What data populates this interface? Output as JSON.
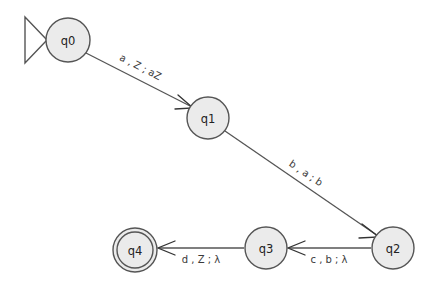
{
  "diagram": {
    "type": "pda-state-diagram",
    "background_color": "#ffffff",
    "node_fill_color": "#ebebeb",
    "node_stroke_color": "#555555",
    "edge_color": "#555555"
  },
  "states": [
    {
      "id": "q0",
      "label": "q0",
      "cx": 68,
      "cy": 40,
      "r": 22,
      "accepting": false,
      "start": true
    },
    {
      "id": "q1",
      "label": "q1",
      "cx": 208,
      "cy": 118,
      "r": 21,
      "accepting": false,
      "start": false
    },
    {
      "id": "q2",
      "label": "q2",
      "cx": 393,
      "cy": 248,
      "r": 21,
      "accepting": false,
      "start": false
    },
    {
      "id": "q3",
      "label": "q3",
      "cx": 266,
      "cy": 248,
      "r": 21,
      "accepting": false,
      "start": false
    },
    {
      "id": "q4",
      "label": "q4",
      "cx": 135,
      "cy": 250,
      "r": 22,
      "accepting": true,
      "start": false
    }
  ],
  "transitions": [
    {
      "from": "q0",
      "to": "q1",
      "label": "a , Z ; aZ",
      "input": "a",
      "pop": "Z",
      "push": "aZ"
    },
    {
      "from": "q1",
      "to": "q2",
      "label": "b , a ; b",
      "input": "b",
      "pop": "a",
      "push": "b"
    },
    {
      "from": "q2",
      "to": "q3",
      "label": "c , b ; λ",
      "input": "c",
      "pop": "b",
      "push": "λ"
    },
    {
      "from": "q3",
      "to": "q4",
      "label": "d , Z ; λ",
      "input": "d",
      "pop": "Z",
      "push": "λ"
    }
  ],
  "start_marker": {
    "name": "start-arrow",
    "shape": "open-triangle"
  }
}
